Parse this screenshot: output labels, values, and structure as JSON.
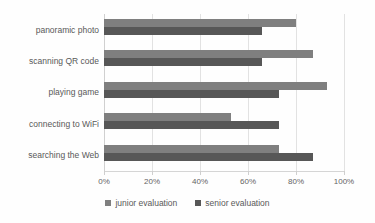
{
  "chart_data": {
    "type": "bar",
    "orientation": "horizontal",
    "title": "",
    "subtitle": "",
    "xlabel": "",
    "ylabel": "",
    "xlim": [
      0,
      100
    ],
    "xticks": [
      "0%",
      "20%",
      "40%",
      "60%",
      "80%",
      "100%"
    ],
    "xtick_values": [
      0,
      20,
      40,
      60,
      80,
      100
    ],
    "grid": true,
    "legend_position": "bottom",
    "categories": [
      "panoramic photo",
      "scanning QR code",
      "playing game",
      "connecting to WiFi",
      "searching the Web"
    ],
    "series": [
      {
        "name": "junior evaluation",
        "color": "#7f7f7f",
        "values": [
          80,
          87,
          93,
          53,
          73
        ]
      },
      {
        "name": "senior evaluation",
        "color": "#575757",
        "values": [
          66,
          66,
          73,
          73,
          87
        ]
      }
    ]
  },
  "legend": {
    "items": [
      {
        "label": "junior evaluation",
        "color": "#7f7f7f"
      },
      {
        "label": "senior evaluation",
        "color": "#575757"
      }
    ]
  }
}
